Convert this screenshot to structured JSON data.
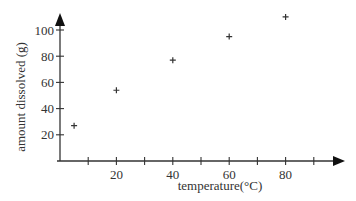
{
  "chart_data": {
    "type": "scatter",
    "title": "",
    "xlabel": "temperature(°C)",
    "ylabel": "amount dissolved (g)",
    "xlim": [
      0,
      100
    ],
    "ylim": [
      0,
      110
    ],
    "x_ticks": [
      10,
      20,
      30,
      40,
      50,
      60,
      70,
      80,
      90
    ],
    "x_tick_labels": [
      "20",
      "40",
      "60",
      "80"
    ],
    "y_ticks": [
      20,
      40,
      60,
      80,
      100
    ],
    "y_tick_labels": [
      "20",
      "40",
      "60",
      "80",
      "100"
    ],
    "grid": false,
    "marker": "+",
    "series": [
      {
        "name": "solubility",
        "x": [
          5,
          20,
          40,
          60,
          80
        ],
        "y": [
          27,
          54,
          77,
          95,
          110
        ]
      }
    ]
  },
  "colors": {
    "axis": "#333333",
    "text": "#333333",
    "background": "#ffffff"
  }
}
